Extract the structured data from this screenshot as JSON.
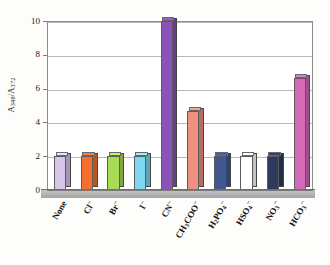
{
  "chart_data": {
    "type": "bar",
    "title": "",
    "xlabel": "",
    "ylabel": "A348/A372",
    "ylabel_parts": {
      "base1": "A",
      "sub1": "348",
      "sep": "/",
      "base2": "A",
      "sub2": "372"
    },
    "categories": [
      "None",
      "Cl-",
      "Br-",
      "I-",
      "CN-",
      "CH3COO-",
      "H2PO4-",
      "HSO4-",
      "NO3-",
      "HCO3-"
    ],
    "category_labels_html": [
      {
        "text": "None",
        "sub": "",
        "sup": ""
      },
      {
        "text": "Cl",
        "sub": "",
        "sup": "-"
      },
      {
        "text": "Br",
        "sub": "",
        "sup": "-"
      },
      {
        "text": "I",
        "sub": "",
        "sup": "-"
      },
      {
        "text": "CN",
        "sub": "",
        "sup": "-"
      },
      {
        "text": "CH3COO",
        "sub": "3",
        "sup": "-"
      },
      {
        "text": "H2PO4",
        "sub": "2,4",
        "sup": "-"
      },
      {
        "text": "HSO4",
        "sub": "4",
        "sup": "-"
      },
      {
        "text": "NO3",
        "sub": "3",
        "sup": "-"
      },
      {
        "text": "HCO3",
        "sub": "3",
        "sup": "-"
      }
    ],
    "values": [
      2.0,
      2.0,
      2.0,
      2.0,
      10.0,
      4.7,
      2.0,
      2.0,
      2.0,
      6.6
    ],
    "colors": [
      "#d8c6ea",
      "#f4702c",
      "#a8dc54",
      "#7fd8f2",
      "#8b52b8",
      "#ef9080",
      "#41588f",
      "#ffffff",
      "#2f3b5e",
      "#d469b8"
    ],
    "ylim": [
      0,
      10
    ],
    "yticks": [
      0,
      2,
      4,
      6,
      8,
      10
    ],
    "ytick_labels": [
      "0",
      "2",
      "4",
      "6",
      "8",
      "10"
    ],
    "grid": true,
    "grid_axis": "y",
    "legend": false,
    "style": "3d-column"
  }
}
